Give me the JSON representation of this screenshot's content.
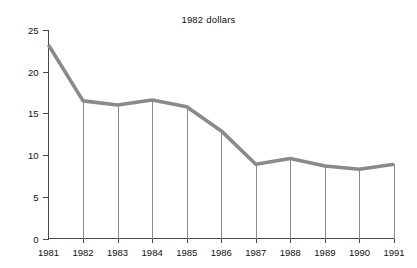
{
  "chart_data": {
    "type": "line",
    "title": "1982 dollars",
    "xlabel": "",
    "ylabel": "",
    "categories": [
      "1981",
      "1982",
      "1983",
      "1984",
      "1985",
      "1986",
      "1987",
      "1988",
      "1989",
      "1990",
      "1991"
    ],
    "values": [
      23.2,
      16.5,
      16.0,
      16.6,
      15.8,
      12.9,
      8.9,
      9.6,
      8.7,
      8.3,
      8.9
    ],
    "series": [
      {
        "name": "1982 dollars",
        "values": [
          23.2,
          16.5,
          16.0,
          16.6,
          15.8,
          12.9,
          8.9,
          9.6,
          8.7,
          8.3,
          8.9
        ]
      }
    ],
    "ylim": [
      0,
      25
    ],
    "yticks": [
      0,
      5,
      10,
      15,
      20,
      25
    ],
    "ytick_labels": [
      "0",
      "5",
      "10",
      "15",
      "20",
      "25"
    ],
    "grid": false,
    "legend": "none",
    "drop_lines": true,
    "line_color": "#8a8a8a",
    "axis_color": "#4a4a4a",
    "background_color": "#ffffff"
  }
}
